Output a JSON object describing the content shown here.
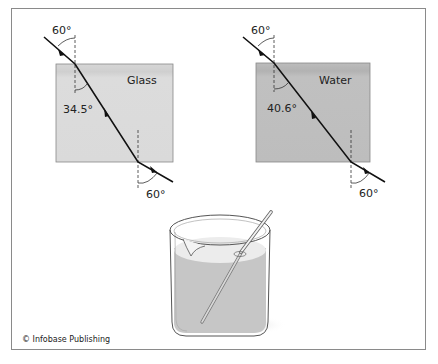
{
  "figure": {
    "credit": "© Infobase Publishing"
  },
  "panels": [
    {
      "material": "Glass",
      "incident_angle": "60°",
      "refracted_angle": "34.5°",
      "exit_angle": "60°",
      "block_color": "#dadada"
    },
    {
      "material": "Water",
      "incident_angle": "60°",
      "refracted_angle": "40.6°",
      "exit_angle": "60°",
      "block_color": "#bdbdbd"
    }
  ],
  "beaker": {
    "description": "Beaker of water with glass stirring rod appearing bent",
    "liquid_color": "#c6c6c6"
  }
}
